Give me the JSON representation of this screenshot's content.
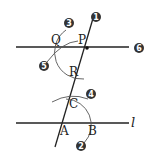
{
  "diagram": {
    "points": {
      "P": "P",
      "Q": "Q",
      "R": "R",
      "A": "A",
      "B": "B",
      "C": "C"
    },
    "line_label": "l",
    "steps": [
      "1",
      "2",
      "3",
      "4",
      "5",
      "6"
    ],
    "colors": {
      "stroke": "#222222",
      "step_badge": "#333333",
      "arc": "#555555"
    }
  }
}
